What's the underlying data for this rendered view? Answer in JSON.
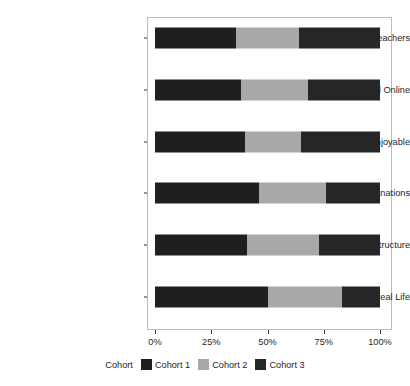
{
  "chart_data": {
    "type": "bar",
    "orientation": "horizontal",
    "stacked": true,
    "stack_normalized": true,
    "title": "",
    "subtitle": "",
    "xlabel": "",
    "ylabel": "",
    "xlim": [
      0,
      100
    ],
    "xticks": [
      0,
      25,
      50,
      75,
      100
    ],
    "xticklabels": [
      "0%",
      "25%",
      "50%",
      "75%",
      "100%"
    ],
    "grid": false,
    "legend_position": "bottom",
    "legend_title": "Cohort",
    "categories": [
      "Great/Supportive Teachers",
      "Support Off and Online",
      "Interesting/Enjoyable",
      "Clear Explanations",
      "Good Structure",
      "Relevant to Real Life"
    ],
    "series": [
      {
        "name": "Cohort 1",
        "color": "#1f1f1f",
        "values": [
          36,
          38,
          40,
          46,
          41,
          50
        ]
      },
      {
        "name": "Cohort 2",
        "color": "#a8a8a8",
        "values": [
          28,
          30,
          25,
          30,
          32,
          33
        ]
      },
      {
        "name": "Cohort 3",
        "color": "#262626",
        "values": [
          36,
          32,
          35,
          24,
          27,
          17
        ]
      }
    ]
  },
  "axis": {
    "y_labels": [
      "Great/Supportive Teachers",
      "Support Off and Online",
      "Interesting/Enjoyable",
      "Clear Explanations",
      "Good Structure",
      "Relevant to Real Life"
    ],
    "x_labels": [
      "0%",
      "25%",
      "50%",
      "75%",
      "100%"
    ]
  },
  "legend": {
    "title": "Cohort",
    "items": [
      {
        "label": "Cohort 1",
        "color": "#1f1f1f"
      },
      {
        "label": "Cohort 2",
        "color": "#a8a8a8"
      },
      {
        "label": "Cohort 3",
        "color": "#262626"
      }
    ]
  },
  "colors": {
    "panel_border": "#bdbdbd",
    "axis_text": "#262626",
    "background": "#ffffff"
  }
}
